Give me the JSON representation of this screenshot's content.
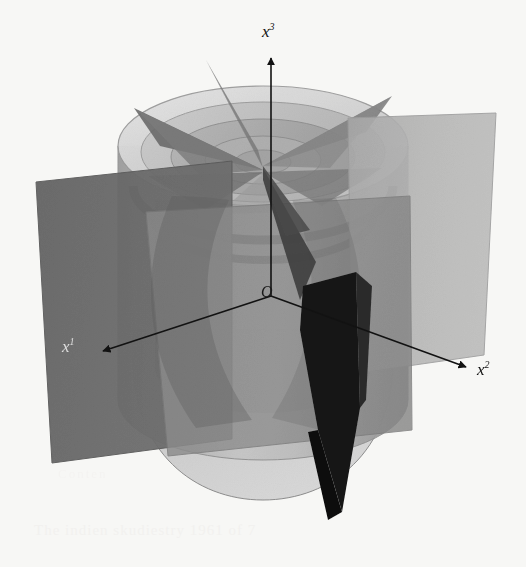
{
  "figure": {
    "kind": "3d-geometry-illustration",
    "background_color": "#f7f7f5"
  },
  "axes": {
    "origin_label": "O",
    "items": [
      {
        "id": "x1",
        "base": "x",
        "exponent": "1",
        "name": "x-one-axis"
      },
      {
        "id": "x2",
        "base": "x",
        "exponent": "2",
        "name": "x-two-axis"
      },
      {
        "id": "x3",
        "base": "x",
        "exponent": "3",
        "name": "x-three-axis"
      }
    ],
    "line_color": "#121212",
    "arrowhead_style": "solid-triangle"
  },
  "palette": {
    "background": "#f7f7f5",
    "left_plane": "#6a6a6a",
    "right_plane": "#b4b4b4",
    "front_plane": "#8d8d8d",
    "cylinder_body_light": "#c9c9c9",
    "cylinder_body_mid": "#a8a8a8",
    "cylinder_body_dark": "#868686",
    "top_face_light": "#dcdcdc",
    "ring_dark": "#5d5d5d",
    "wedge_mid": "#707070",
    "wedge_dark": "#141414",
    "outline": "#6f6f6f"
  },
  "bleed_through": {
    "note": "faint scanner show-through from reverse page, illegible",
    "line_upper": "Conten",
    "line_lower": "The indien skudiestry 1961 of 7"
  }
}
